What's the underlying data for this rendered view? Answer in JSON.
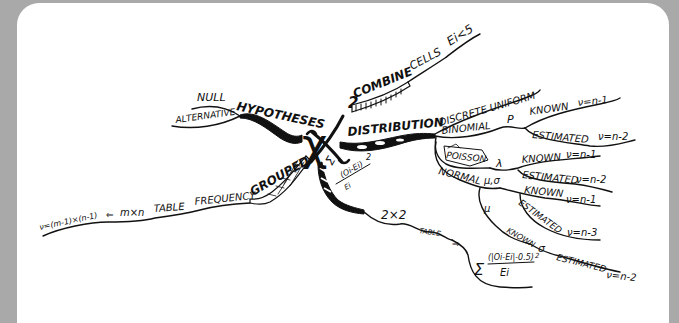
{
  "diagram": {
    "type": "mind-map",
    "center": {
      "label": "χ",
      "superscript": "2"
    },
    "background_color": "#a9a9a9",
    "card_color": "#ffffff",
    "ink_color": "#111111",
    "branches": {
      "hypotheses": {
        "label": "HYPOTHESES",
        "children": [
          "NULL",
          "ALTERNATIVE"
        ]
      },
      "combine": {
        "label": "COMBINE",
        "children": [
          "CELLS",
          "Ei<5"
        ]
      },
      "distribution": {
        "label": "DISTRIBUTION",
        "children": {
          "discrete_uniform": "DISCRETE UNIFORM",
          "binomial": {
            "label": "BINOMIAL",
            "param": "P",
            "known": "KNOWN",
            "known_dof": "ν=n-1",
            "estimated": "ESTIMATED",
            "estimated_dof": "ν=n-2"
          },
          "poisson": {
            "label": "POISSON",
            "param": "λ",
            "known": "KNOWN",
            "known_dof": "ν=n-1",
            "estimated": "ESTIMATED",
            "estimated_dof": "ν=n-2"
          },
          "normal": {
            "label": "NORMAL",
            "param": "μ,σ",
            "known": "KNOWN",
            "known_dof": "ν=n-1",
            "estimated": "ESTIMATED",
            "estimated_dof": "ν=n-3",
            "mu_branch": {
              "label": "μ",
              "known": "KNOWN",
              "sigma": "σ",
              "estimated": "ESTIMATED",
              "estimated_dof": "ν=n-2"
            }
          }
        }
      },
      "formula": {
        "sum": "Σ",
        "numerator": "(Oi-Ei)",
        "exponent": "2",
        "denominator": "Ei",
        "child": "2×2",
        "table": "TABLE",
        "arrow": "⇒",
        "yates_sum": "Σ",
        "yates_numerator": "(|Oi-Ei|-0.5)",
        "yates_exponent": "2",
        "yates_denominator": "Ei"
      },
      "grouped": {
        "label": "GROUPED",
        "children": [
          "FREQUENCY",
          "TABLE",
          "m×n",
          "⇐",
          "ν=(m-1)×(n-1)"
        ]
      }
    }
  }
}
